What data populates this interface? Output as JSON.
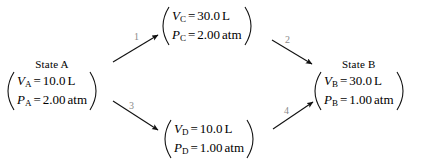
{
  "diagram": {
    "type": "thermodynamic-path-diagram",
    "background_color": "#ffffff",
    "text_color": "#000000",
    "label_color": "#8a8a8a",
    "states": [
      {
        "id": "A",
        "title": "State A",
        "volume_symbol": "V",
        "volume_subscript": "A",
        "volume_equals": "=",
        "volume_value": "10.0",
        "volume_unit": "L",
        "pressure_symbol": "P",
        "pressure_subscript": "A",
        "pressure_equals": "=",
        "pressure_value": "2.00",
        "pressure_unit": "atm"
      },
      {
        "id": "C",
        "title": "",
        "volume_symbol": "V",
        "volume_subscript": "C",
        "volume_equals": "=",
        "volume_value": "30.0",
        "volume_unit": "L",
        "pressure_symbol": "P",
        "pressure_subscript": "C",
        "pressure_equals": "=",
        "pressure_value": "2.00",
        "pressure_unit": "atm"
      },
      {
        "id": "B",
        "title": "State B",
        "volume_symbol": "V",
        "volume_subscript": "B",
        "volume_equals": "=",
        "volume_value": "30.0",
        "volume_unit": "L",
        "pressure_symbol": "P",
        "pressure_subscript": "B",
        "pressure_equals": "=",
        "pressure_value": "1.00",
        "pressure_unit": "atm"
      },
      {
        "id": "D",
        "title": "",
        "volume_symbol": "V",
        "volume_subscript": "D",
        "volume_equals": "=",
        "volume_value": "10.0",
        "volume_unit": "L",
        "pressure_symbol": "P",
        "pressure_subscript": "D",
        "pressure_equals": "=",
        "pressure_value": "1.00",
        "pressure_unit": "atm"
      }
    ],
    "steps": [
      {
        "label": "1",
        "from": "A",
        "to": "C"
      },
      {
        "label": "2",
        "from": "C",
        "to": "B"
      },
      {
        "label": "3",
        "from": "A",
        "to": "D"
      },
      {
        "label": "4",
        "from": "D",
        "to": "B"
      }
    ]
  }
}
